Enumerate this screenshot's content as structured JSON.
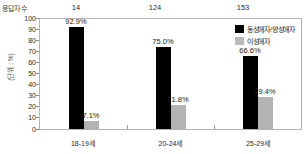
{
  "top_row": {
    "label": "응답자 수",
    "counts": [
      "14",
      "124",
      "153"
    ]
  },
  "axis": {
    "unit_label": "(단위 : %)",
    "yticks": [
      "100",
      "90",
      "80",
      "70",
      "60",
      "50",
      "40",
      "30",
      "20",
      "10",
      "0"
    ]
  },
  "legend": {
    "items": [
      {
        "label": "동성애자/양성애자",
        "color": "#000000"
      },
      {
        "label": "이성애자",
        "color": "#b9b9b9"
      }
    ]
  },
  "chart_data": {
    "type": "bar",
    "title": "",
    "subtitle": "",
    "xlabel": "",
    "ylabel": "(단위 : %)",
    "ylim": [
      0,
      100
    ],
    "ytick_step": 10,
    "grid": false,
    "legend_position": "top-right",
    "categories": [
      "18-19세",
      "20-24세",
      "25-29세"
    ],
    "group_counts": [
      14,
      124,
      153
    ],
    "series": [
      {
        "name": "동성애자/양성애자",
        "color": "#000000",
        "values": [
          92.9,
          75.0,
          66.6
        ],
        "labels": [
          "92.9%",
          "75.0%",
          "66.6%"
        ]
      },
      {
        "name": "이성애자",
        "color": "#b3b3b3",
        "values": [
          7.1,
          21.8,
          29.4
        ],
        "labels": [
          "7.1%",
          "21.8%",
          "29.4%"
        ]
      }
    ]
  }
}
